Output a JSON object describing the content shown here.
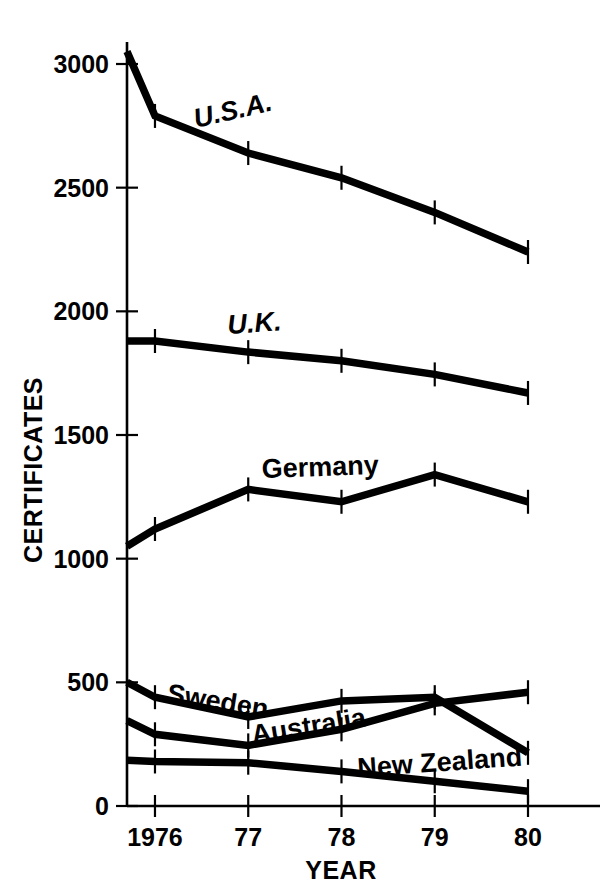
{
  "chart_data": {
    "type": "line",
    "title": "",
    "xlabel": "YEAR",
    "ylabel": "CERTIFICATES",
    "x": [
      1975.7,
      1976,
      1977,
      1978,
      1979,
      1980
    ],
    "xtick_values": [
      1976,
      1977,
      1978,
      1979,
      1980
    ],
    "xtick_labels": [
      "1976",
      "77",
      "78",
      "79",
      "80"
    ],
    "ytick_values": [
      0,
      500,
      1000,
      1500,
      2000,
      2500,
      3000
    ],
    "ytick_labels": [
      "0",
      "500",
      "1000",
      "1500",
      "2000",
      "2500",
      "3000"
    ],
    "xlim": [
      1975.7,
      1980
    ],
    "ylim": [
      0,
      3100
    ],
    "grid": false,
    "legend": "inline-labels",
    "line_color": "#000000",
    "series": [
      {
        "name": "U.S.A.",
        "label": "U.S.A.",
        "label_style": "italic",
        "values": [
          3050,
          2790,
          2640,
          2540,
          2400,
          2240
        ]
      },
      {
        "name": "U.K.",
        "label": "U.K.",
        "label_style": "italic",
        "values": [
          1880,
          1880,
          1835,
          1800,
          1745,
          1670
        ]
      },
      {
        "name": "Germany",
        "label": "Germany",
        "label_style": "normal",
        "values": [
          1050,
          1120,
          1280,
          1230,
          1340,
          1230
        ]
      },
      {
        "name": "Sweden",
        "label": "Sweden",
        "label_style": "normal",
        "values": [
          500,
          440,
          360,
          425,
          440,
          215
        ]
      },
      {
        "name": "Australia",
        "label": "Australia",
        "label_style": "normal",
        "values": [
          345,
          290,
          245,
          310,
          415,
          460
        ]
      },
      {
        "name": "New Zealand",
        "label": "New Zealand",
        "label_style": "normal",
        "values": [
          185,
          180,
          175,
          140,
          100,
          60
        ]
      }
    ]
  }
}
